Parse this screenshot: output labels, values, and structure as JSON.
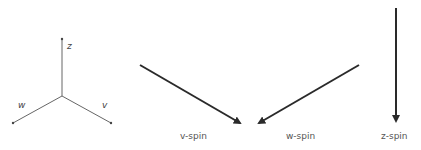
{
  "axes": {
    "z_label": "z",
    "w_label": "w",
    "v_label": "v"
  },
  "spins": [
    {
      "label": "v-spin"
    },
    {
      "label": "w-spin"
    },
    {
      "label": "z-spin"
    }
  ],
  "colors": {
    "axis": "#555555",
    "arrow": "#2a2a2a",
    "text": "#555555"
  }
}
